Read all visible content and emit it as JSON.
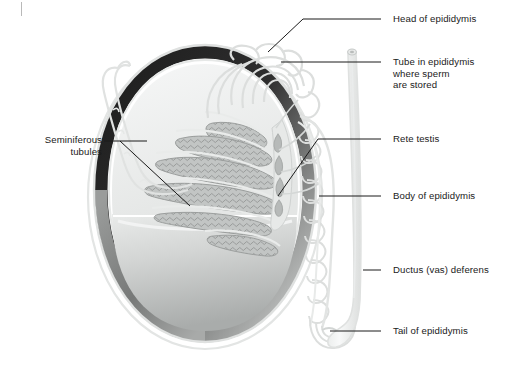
{
  "figure": {
    "type": "anatomical-diagram",
    "background": "#ffffff",
    "line_color": "#1a1a1a",
    "structure_outline_color": "#d7d9d8",
    "tunica_dark_color": "#2b2b2b",
    "tubule_fill_color": "#b9bcbb",
    "testis_body_color": "#c9cbca"
  },
  "labels": [
    {
      "id": "head-of-epididymis",
      "text": "Head of epididymis",
      "side": "right",
      "x": 393,
      "y": 14,
      "leader": {
        "x1": 381,
        "y1": 19,
        "x2": 268,
        "y2": 52
      }
    },
    {
      "id": "tube-in-epididymis",
      "text": "Tube in epididymis\nwhere sperm\nare stored",
      "side": "right",
      "x": 393,
      "y": 57,
      "leader": {
        "x1": 381,
        "y1": 62,
        "x2": 281,
        "y2": 62
      }
    },
    {
      "id": "rete-testis",
      "text": "Rete testis",
      "side": "right",
      "x": 393,
      "y": 134,
      "leader": {
        "x1": 381,
        "y1": 139,
        "x2": 278,
        "y2": 196
      }
    },
    {
      "id": "body-of-epididymis",
      "text": "Body of epididymis",
      "side": "right",
      "x": 393,
      "y": 190,
      "leader": {
        "x1": 381,
        "y1": 196,
        "x2": 319,
        "y2": 196
      }
    },
    {
      "id": "ductus-vas-deferens",
      "text": "Ductus (vas) deferens",
      "side": "right",
      "x": 393,
      "y": 265,
      "leader": {
        "x1": 381,
        "y1": 270,
        "x2": 364,
        "y2": 270
      }
    },
    {
      "id": "tail-of-epididymis",
      "text": "Tail of epididymis",
      "side": "right",
      "x": 393,
      "y": 326,
      "leader": {
        "x1": 381,
        "y1": 331,
        "x2": 330,
        "y2": 331
      }
    },
    {
      "id": "seminiferous-tubules",
      "text": "Seminiferous\ntubules",
      "side": "left",
      "x": 16,
      "y": 135,
      "width": 86,
      "leaders": [
        {
          "x1": 104,
          "y1": 141,
          "x2": 147,
          "y2": 141
        },
        {
          "x1": 104,
          "y1": 141,
          "x2": 190,
          "y2": 206
        }
      ]
    }
  ],
  "corner_mark": {
    "present": true,
    "x": 21,
    "y": 2,
    "width": 1,
    "height": 14,
    "color": "#b9b9b9"
  }
}
